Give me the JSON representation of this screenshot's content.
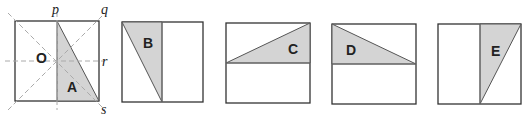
{
  "diagram": {
    "panels": [
      {
        "id": "original",
        "shape_label": "A",
        "center_label": "O",
        "axes": [
          "p",
          "q",
          "r",
          "s"
        ]
      },
      {
        "id": "image-B",
        "shape_label": "B"
      },
      {
        "id": "image-C",
        "shape_label": "C"
      },
      {
        "id": "image-D",
        "shape_label": "D"
      },
      {
        "id": "image-E",
        "shape_label": "E"
      }
    ],
    "colors": {
      "shade": "#d4d4d4",
      "outline": "#333333",
      "guides": "#aaaaaa"
    }
  }
}
